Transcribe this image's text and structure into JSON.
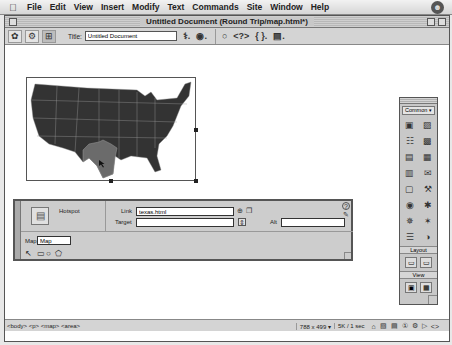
{
  "menubar": {
    "apple": "",
    "items": [
      "File",
      "Edit",
      "View",
      "Insert",
      "Modify",
      "Text",
      "Commands",
      "Site",
      "Window",
      "Help"
    ],
    "right_icon": "☻"
  },
  "window": {
    "title": "Untitled Document (Round Trip/map.html*)"
  },
  "toolbar": {
    "view_buttons": [
      "✿",
      "⚙",
      "⊞"
    ],
    "title_label": "Title:",
    "title_value": "Untitled Document",
    "icons_a": [
      "⚕.",
      "◉."
    ],
    "icons_b": [
      "○",
      "<?>",
      "{ }.",
      "▤."
    ]
  },
  "document": {
    "map_image": {
      "name": "United States map",
      "highlighted_region": "Texas",
      "hotspot_color": "#6b6b6b",
      "land_color": "#333333"
    }
  },
  "properties": {
    "type_label": "Hotspot",
    "link_label": "Link",
    "link_value": "texas.html",
    "target_label": "Target",
    "target_value": "",
    "alt_label": "Alt",
    "alt_value": "",
    "map_label": "Map",
    "map_value": "Map",
    "help_icon": "?",
    "edit_icon": "✎",
    "link_icons": [
      "⊕",
      "❐"
    ],
    "target_dropdown": "⇕",
    "tools": [
      "↖",
      "▭",
      "○",
      "⬠"
    ]
  },
  "insert_panel": {
    "category": "Common",
    "arrow": "▾",
    "icons": [
      "▣",
      "▨",
      "☷",
      "▩",
      "▤",
      "▦",
      "▥",
      "✉",
      "▢",
      "⚒",
      "◉",
      "✱",
      "✵",
      "✶",
      "☰",
      "◑"
    ],
    "layout_label": "Layout",
    "layout_icons": [
      "▭",
      "▭"
    ],
    "view_label": "View",
    "view_icons": [
      "▣",
      "▦"
    ]
  },
  "statusbar": {
    "tag_selector": "<body> <p> <map> <area>",
    "window_size": "788 x 499",
    "size_arrow": "▾",
    "download": "5K / 1 sec",
    "launcher_icons": [
      "⌂",
      "▧",
      "▤",
      "①",
      "⚙",
      "▷",
      "<>"
    ]
  }
}
